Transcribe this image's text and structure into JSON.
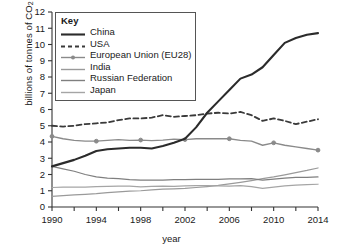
{
  "chart_data": {
    "type": "line",
    "title": "",
    "xlabel": "year",
    "ylabel": "billions of tonnes of CO2",
    "ylabel_prefix": "billions of tonnes of CO",
    "ylabel_sub": "2",
    "xlim": [
      1990,
      2014
    ],
    "ylim": [
      0,
      12
    ],
    "ytick_values": [
      0,
      1,
      2,
      3,
      4,
      5,
      6,
      7,
      8,
      9,
      10,
      11,
      12
    ],
    "xtick_values": [
      1990,
      1992,
      1994,
      1996,
      1998,
      2000,
      2002,
      2004,
      2006,
      2008,
      2010,
      2012,
      2014
    ],
    "xtick_labels_shown": [
      "1990",
      "1994",
      "1998",
      "2002",
      "2006",
      "2010",
      "2014"
    ],
    "grid": false,
    "legend_position": "upper-left-inside",
    "legend_title": "Key",
    "x": [
      1990,
      1991,
      1992,
      1993,
      1994,
      1995,
      1996,
      1997,
      1998,
      1999,
      2000,
      2001,
      2002,
      2003,
      2004,
      2005,
      2006,
      2007,
      2008,
      2009,
      2010,
      2011,
      2012,
      2013,
      2014
    ],
    "series": [
      {
        "name": "China",
        "style": "solid-thick",
        "color": "#2b2b2b",
        "markers": false,
        "values": [
          2.5,
          2.7,
          2.9,
          3.15,
          3.45,
          3.55,
          3.6,
          3.65,
          3.65,
          3.6,
          3.75,
          3.95,
          4.2,
          4.9,
          5.8,
          6.5,
          7.2,
          7.9,
          8.15,
          8.6,
          9.35,
          10.1,
          10.4,
          10.6,
          10.7
        ]
      },
      {
        "name": "USA",
        "style": "dashed",
        "color": "#3a3a3a",
        "markers": false,
        "values": [
          5.0,
          4.95,
          5.0,
          5.1,
          5.15,
          5.2,
          5.35,
          5.45,
          5.45,
          5.5,
          5.65,
          5.55,
          5.6,
          5.65,
          5.75,
          5.8,
          5.75,
          5.85,
          5.65,
          5.3,
          5.45,
          5.3,
          5.1,
          5.25,
          5.4
        ]
      },
      {
        "name": "European Union (EU28)",
        "style": "solid-marker",
        "color": "#8a8a8a",
        "markers": true,
        "marker_years": [
          1990,
          1994,
          1998,
          2002,
          2006,
          2010,
          2014
        ],
        "marker_values": [
          4.35,
          4.05,
          4.12,
          4.15,
          4.2,
          3.95,
          3.5
        ],
        "values": [
          4.35,
          4.2,
          4.1,
          4.05,
          4.05,
          4.1,
          4.15,
          4.1,
          4.12,
          4.08,
          4.12,
          4.18,
          4.15,
          4.2,
          4.2,
          4.2,
          4.2,
          4.1,
          4.05,
          3.8,
          3.95,
          3.8,
          3.7,
          3.6,
          3.5
        ]
      },
      {
        "name": "India",
        "style": "solid",
        "color": "#9a9a9a",
        "markers": false,
        "values": [
          0.65,
          0.7,
          0.75,
          0.78,
          0.82,
          0.88,
          0.93,
          0.97,
          1.0,
          1.05,
          1.1,
          1.12,
          1.15,
          1.2,
          1.26,
          1.33,
          1.42,
          1.52,
          1.63,
          1.75,
          1.85,
          1.98,
          2.12,
          2.25,
          2.4
        ]
      },
      {
        "name": "Russian Federation",
        "style": "solid",
        "color": "#7f7f7f",
        "markers": false,
        "values": [
          2.5,
          2.35,
          2.2,
          2.0,
          1.85,
          1.78,
          1.75,
          1.68,
          1.65,
          1.65,
          1.66,
          1.68,
          1.68,
          1.7,
          1.7,
          1.7,
          1.73,
          1.73,
          1.75,
          1.65,
          1.72,
          1.78,
          1.82,
          1.82,
          1.85
        ]
      },
      {
        "name": "Japan",
        "style": "solid",
        "color": "#a5a5a5",
        "markers": false,
        "values": [
          1.2,
          1.22,
          1.23,
          1.22,
          1.26,
          1.27,
          1.29,
          1.28,
          1.24,
          1.27,
          1.29,
          1.27,
          1.3,
          1.32,
          1.31,
          1.3,
          1.29,
          1.31,
          1.25,
          1.15,
          1.22,
          1.3,
          1.35,
          1.38,
          1.4
        ]
      }
    ]
  }
}
